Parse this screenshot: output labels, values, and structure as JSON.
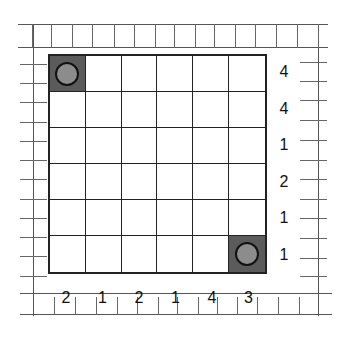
{
  "puzzle": {
    "rows": 6,
    "cols": 6,
    "cells": [
      [
        "filled-disc",
        "empty",
        "empty",
        "empty",
        "empty",
        "empty"
      ],
      [
        "empty",
        "empty",
        "empty",
        "empty",
        "empty",
        "empty"
      ],
      [
        "empty",
        "empty",
        "empty",
        "empty",
        "empty",
        "empty"
      ],
      [
        "empty",
        "empty",
        "empty",
        "empty",
        "empty",
        "empty"
      ],
      [
        "empty",
        "empty",
        "empty",
        "empty",
        "empty",
        "empty"
      ],
      [
        "empty",
        "empty",
        "empty",
        "empty",
        "empty",
        "filled-disc"
      ]
    ],
    "right_clues": [
      "4",
      "4",
      "1",
      "2",
      "1",
      "1"
    ],
    "bottom_clues": [
      "2",
      "1",
      "2",
      "1",
      "4",
      "3"
    ]
  },
  "colors": {
    "filled_cell": "#5b5b5b",
    "disc_fill": "#8c8c8c",
    "grid_line": "#222222",
    "frame_line": "#555555"
  }
}
